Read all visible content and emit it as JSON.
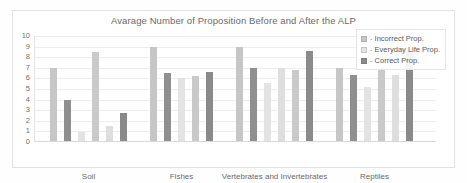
{
  "chart_data": {
    "type": "bar",
    "title": "Avarage Number of Proposition Before and After the ALP",
    "xlabel": "",
    "ylabel": "",
    "ylim": [
      0,
      10
    ],
    "yticks": [
      0,
      1,
      2,
      3,
      4,
      5,
      6,
      7,
      8,
      9,
      10
    ],
    "grid": true,
    "legend_position": "top-right",
    "categories": [
      "Soil",
      "Fishes",
      "Vertebrates and Invertebrates",
      "Reptiles"
    ],
    "series": [
      {
        "name": "Incorrect Prop.",
        "color": "#bfbfbf",
        "values_before": [
          7,
          9,
          9,
          7
        ],
        "values_after": [
          8.5,
          6.5,
          7,
          7
        ]
      },
      {
        "name": "Everyday Life Prop.",
        "color": "#e0e0e0",
        "values_before": [
          0,
          6,
          6,
          6
        ],
        "values_after": [
          1.5,
          0,
          7,
          6.5
        ]
      },
      {
        "name": "Correct Prop.",
        "color": "#8c8c8c",
        "values_before": [
          4,
          6.5,
          6.5,
          6.5
        ],
        "values_after": [
          2.7,
          0,
          8.5,
          8.5
        ]
      }
    ],
    "bars": [
      {
        "group": "Soil",
        "series": "Incorrect Prop.",
        "phase": "Before",
        "value": 7.0,
        "color": "#c6c6c6"
      },
      {
        "group": "Soil",
        "series": "Correct Prop.",
        "phase": "Before",
        "value": 4.0,
        "color": "#8f8f8f"
      },
      {
        "group": "Soil",
        "series": "Everyday Life Prop.",
        "phase": "Before",
        "value": 0.9,
        "color": "#e3e3e3"
      },
      {
        "group": "Soil",
        "series": "Incorrect Prop.",
        "phase": "After",
        "value": 8.5,
        "color": "#c9c9c9"
      },
      {
        "group": "Soil",
        "series": "Everyday Life Prop.",
        "phase": "After",
        "value": 1.5,
        "color": "#dedede"
      },
      {
        "group": "Soil",
        "series": "Correct Prop.",
        "phase": "After",
        "value": 2.7,
        "color": "#8a8a8a"
      },
      {
        "group": "Fishes",
        "series": "Incorrect Prop.",
        "phase": "Before",
        "value": 9.0,
        "color": "#c6c6c6"
      },
      {
        "group": "Fishes",
        "series": "Correct Prop.",
        "phase": "Before",
        "value": 6.5,
        "color": "#8f8f8f"
      },
      {
        "group": "Fishes",
        "series": "Everyday Life Prop.",
        "phase": "Before",
        "value": 6.0,
        "color": "#e3e3e3"
      },
      {
        "group": "Fishes",
        "series": "Incorrect Prop.",
        "phase": "After",
        "value": 6.2,
        "color": "#c9c9c9"
      },
      {
        "group": "Fishes",
        "series": "Correct Prop.",
        "phase": "After",
        "value": 6.6,
        "color": "#8a8a8a"
      },
      {
        "group": "Vertebrates and Invertebrates",
        "series": "Incorrect Prop.",
        "phase": "Before",
        "value": 9.0,
        "color": "#c6c6c6"
      },
      {
        "group": "Vertebrates and Invertebrates",
        "series": "Correct Prop.",
        "phase": "Before",
        "value": 7.0,
        "color": "#8f8f8f"
      },
      {
        "group": "Vertebrates and Invertebrates",
        "series": "Everyday Life Prop.",
        "phase": "Before",
        "value": 5.6,
        "color": "#e3e3e3"
      },
      {
        "group": "Vertebrates and Invertebrates",
        "series": "Everyday Life Prop.",
        "phase": "After",
        "value": 7.0,
        "color": "#dedede"
      },
      {
        "group": "Vertebrates and Invertebrates",
        "series": "Incorrect Prop.",
        "phase": "After",
        "value": 6.8,
        "color": "#c9c9c9"
      },
      {
        "group": "Vertebrates and Invertebrates",
        "series": "Correct Prop.",
        "phase": "After",
        "value": 8.6,
        "color": "#8a8a8a"
      },
      {
        "group": "Reptiles",
        "series": "Incorrect Prop.",
        "phase": "Before",
        "value": 7.0,
        "color": "#c6c6c6"
      },
      {
        "group": "Reptiles",
        "series": "Correct Prop.",
        "phase": "Before",
        "value": 6.3,
        "color": "#8f8f8f"
      },
      {
        "group": "Reptiles",
        "series": "Everyday Life Prop.",
        "phase": "Before",
        "value": 5.2,
        "color": "#e3e3e3"
      },
      {
        "group": "Reptiles",
        "series": "Incorrect Prop.",
        "phase": "After",
        "value": 7.0,
        "color": "#c9c9c9"
      },
      {
        "group": "Reptiles",
        "series": "Everyday Life Prop.",
        "phase": "After",
        "value": 6.3,
        "color": "#dedede"
      },
      {
        "group": "Reptiles",
        "series": "Correct Prop.",
        "phase": "After",
        "value": 8.6,
        "color": "#8a8a8a"
      }
    ]
  },
  "legend": {
    "dash": "-",
    "items": [
      {
        "label": "Incorrect Prop.",
        "color": "#c6c6c6"
      },
      {
        "label": "Everyday Life Prop.",
        "color": "#e3e3e3"
      },
      {
        "label": "Correct Prop.",
        "color": "#8c8c8c"
      }
    ]
  }
}
